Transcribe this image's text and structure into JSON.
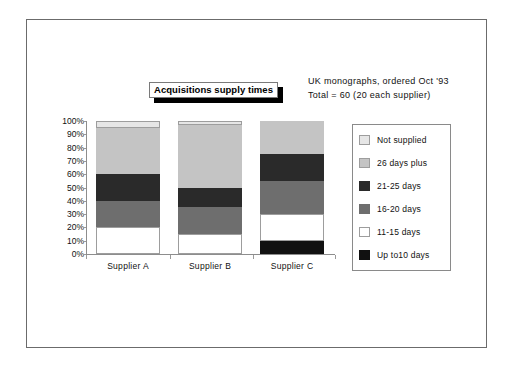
{
  "figure": {
    "title": "Acquisitions supply times",
    "caption_line1": "UK monographs, ordered Oct '93",
    "caption_line2": "Total = 60 (20 each supplier)"
  },
  "chart_data": {
    "type": "bar",
    "stacked": true,
    "title": "Acquisitions supply times",
    "subtitle": "UK monographs, ordered Oct '93 / Total = 60 (20 each supplier)",
    "xlabel": "",
    "ylabel": "",
    "ylim": [
      0,
      100
    ],
    "yunit": "%",
    "ytick_labels": [
      "0%",
      "10%",
      "20%",
      "30%",
      "40%",
      "50%",
      "60%",
      "70%",
      "80%",
      "90%",
      "100%"
    ],
    "ytick_values": [
      0,
      10,
      20,
      30,
      40,
      50,
      60,
      70,
      80,
      90,
      100
    ],
    "grid": false,
    "legend_position": "right",
    "categories": [
      "Supplier A",
      "Supplier B",
      "Supplier C"
    ],
    "series": [
      {
        "name": "Up to10 days",
        "color": "#111111",
        "values": [
          0,
          0,
          10
        ]
      },
      {
        "name": "11-15  days",
        "color": "#ffffff",
        "values": [
          20,
          15,
          20
        ]
      },
      {
        "name": "16-20  days",
        "color": "#6e6e6e",
        "values": [
          20,
          20,
          25
        ]
      },
      {
        "name": "21-25  days",
        "color": "#2a2a2a",
        "values": [
          20,
          15,
          20
        ]
      },
      {
        "name": "26 days plus",
        "color": "#c4c4c4",
        "values": [
          35,
          47,
          25
        ]
      },
      {
        "name": "Not  supplied",
        "color": "#e6e6e6",
        "values": [
          5,
          3,
          0
        ]
      }
    ]
  },
  "legend": {
    "items": [
      {
        "label": "Not  supplied",
        "color": "#e6e6e6"
      },
      {
        "label": "26 days plus",
        "color": "#c4c4c4"
      },
      {
        "label": "21-25  days",
        "color": "#2a2a2a"
      },
      {
        "label": "16-20  days",
        "color": "#6e6e6e"
      },
      {
        "label": "11-15  days",
        "color": "#ffffff"
      },
      {
        "label": "Up to10 days",
        "color": "#111111"
      }
    ]
  }
}
